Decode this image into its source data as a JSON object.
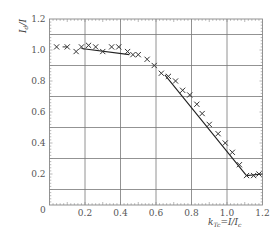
{
  "chart_data": {
    "type": "scatter",
    "title": "",
    "xlabel": "k_Tc = I/I_c",
    "ylabel": "I_d/I",
    "xlim": [
      0,
      1.2
    ],
    "ylim": [
      0,
      1.2
    ],
    "grid": true,
    "x_gridlines": [
      0.2,
      0.4,
      0.6,
      0.8,
      1.0
    ],
    "y_gridlines": [
      0.1,
      0.3,
      0.5,
      0.7,
      0.9,
      1.1
    ],
    "x_ticks": [
      {
        "value": 0.2,
        "label": "0.2"
      },
      {
        "value": 0.4,
        "label": "0.4"
      },
      {
        "value": 0.6,
        "label": "0.6"
      },
      {
        "value": 0.8,
        "label": "0.8"
      },
      {
        "value": 1.0,
        "label": "1.0"
      },
      {
        "value": 1.2,
        "label": "1.2"
      }
    ],
    "y_ticks": [
      {
        "value": 0.2,
        "label": "0.2"
      },
      {
        "value": 0.4,
        "label": "0.4"
      },
      {
        "value": 0.6,
        "label": "0.6"
      },
      {
        "value": 0.8,
        "label": "0.8"
      },
      {
        "value": 1.0,
        "label": "1.0"
      },
      {
        "value": 1.2,
        "label": "1.2"
      }
    ],
    "origin_label": "0",
    "series": [
      {
        "name": "measured",
        "marker": "x",
        "points": [
          [
            0.04,
            1.02
          ],
          [
            0.1,
            1.02
          ],
          [
            0.15,
            0.99
          ],
          [
            0.18,
            1.02
          ],
          [
            0.22,
            1.03
          ],
          [
            0.26,
            1.02
          ],
          [
            0.3,
            0.99
          ],
          [
            0.35,
            1.02
          ],
          [
            0.39,
            1.02
          ],
          [
            0.44,
            0.99
          ],
          [
            0.47,
            0.97
          ],
          [
            0.5,
            0.97
          ],
          [
            0.55,
            0.94
          ],
          [
            0.59,
            0.9
          ],
          [
            0.63,
            0.85
          ],
          [
            0.67,
            0.83
          ],
          [
            0.71,
            0.8
          ],
          [
            0.75,
            0.74
          ],
          [
            0.79,
            0.71
          ],
          [
            0.83,
            0.65
          ],
          [
            0.86,
            0.59
          ],
          [
            0.9,
            0.52
          ],
          [
            0.95,
            0.46
          ],
          [
            0.99,
            0.4
          ],
          [
            1.03,
            0.34
          ],
          [
            1.07,
            0.26
          ],
          [
            1.11,
            0.19
          ],
          [
            1.15,
            0.19
          ],
          [
            1.18,
            0.2
          ]
        ]
      }
    ],
    "lines": [
      {
        "name": "fit-segment-low",
        "points": [
          [
            0.18,
            1.01
          ],
          [
            0.45,
            0.97
          ]
        ]
      },
      {
        "name": "fit-segment-high",
        "points": [
          [
            0.65,
            0.84
          ],
          [
            1.11,
            0.19
          ],
          [
            1.2,
            0.2
          ]
        ]
      }
    ],
    "dash_annotations": [
      [
        0.085,
        1.02
      ]
    ]
  }
}
